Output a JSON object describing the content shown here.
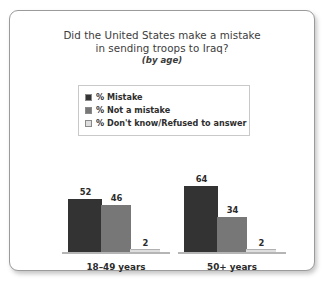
{
  "card": {
    "title_lines": [
      "Did the United States make a mistake",
      "in sending troops to Iraq?"
    ],
    "subtitle": "(by age)"
  },
  "legend": {
    "items": [
      {
        "label": "% Mistake",
        "color": "#333333"
      },
      {
        "label": "% Not a mistake",
        "color": "#777777"
      },
      {
        "label": "% Don't know/Refused to answer",
        "color": "#dedede"
      }
    ]
  },
  "chart_data": {
    "type": "bar",
    "title": "Did the United States make a mistake in sending troops to Iraq?",
    "subtitle": "(by age)",
    "xlabel": "",
    "ylabel": "",
    "ylim": [
      0,
      70
    ],
    "grid": false,
    "legend_position": "top",
    "categories": [
      "18–49 years",
      "50+ years"
    ],
    "series": [
      {
        "name": "% Mistake",
        "color": "#333333",
        "values": [
          52,
          46
        ]
      },
      {
        "name": "% Not a mistake",
        "color": "#777777",
        "values": [
          46,
          34
        ]
      },
      {
        "name": "% Don't know/Refused to answer",
        "color": "#dedede",
        "values": [
          2,
          2
        ]
      }
    ],
    "groups": [
      {
        "category": "18–49 years",
        "bars": [
          {
            "series": "% Mistake",
            "value": 52,
            "color": "#333333"
          },
          {
            "series": "% Not a mistake",
            "value": 46,
            "color": "#777777"
          },
          {
            "series": "% Don't know/Refused to answer",
            "value": 2,
            "color": "#dedede"
          }
        ]
      },
      {
        "category": "50+ years",
        "bars": [
          {
            "series": "% Mistake",
            "value": 64,
            "color": "#333333"
          },
          {
            "series": "% Not a mistake",
            "value": 34,
            "color": "#777777"
          },
          {
            "series": "% Don't know/Refused to answer",
            "value": 2,
            "color": "#dedede"
          }
        ]
      }
    ]
  }
}
